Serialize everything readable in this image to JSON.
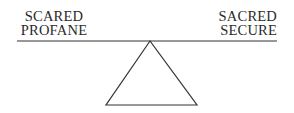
{
  "diagram": {
    "type": "balance-scale",
    "left_labels": [
      "SCARED",
      "PROFANE"
    ],
    "right_labels": [
      "SACRED",
      "SECURE"
    ],
    "line_color": "#333333",
    "text_color": "#2a2a2a",
    "background": "#ffffff"
  }
}
